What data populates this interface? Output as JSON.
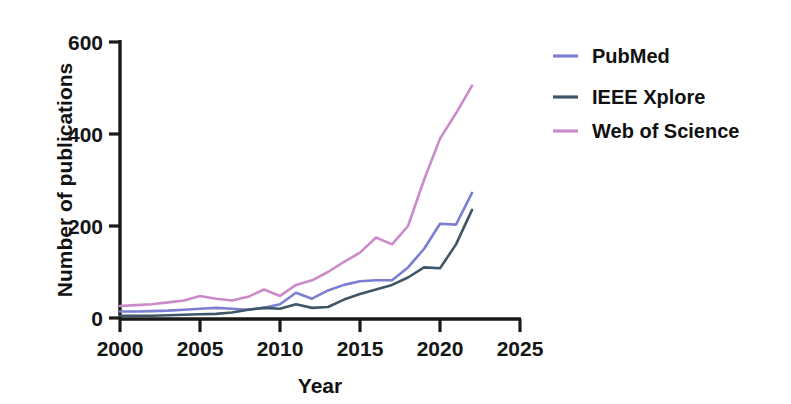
{
  "chart_data": {
    "type": "line",
    "title": "",
    "xlabel": "Year",
    "ylabel": "Number of publications",
    "xlim": [
      2000,
      2025
    ],
    "ylim": [
      0,
      600
    ],
    "xticks": [
      2000,
      2005,
      2010,
      2015,
      2020,
      2025
    ],
    "yticks": [
      0,
      200,
      400,
      600
    ],
    "grid": false,
    "legend_position": "right",
    "x": [
      2000,
      2001,
      2002,
      2003,
      2004,
      2005,
      2006,
      2007,
      2008,
      2009,
      2010,
      2011,
      2012,
      2013,
      2014,
      2015,
      2016,
      2017,
      2018,
      2019,
      2020,
      2021,
      2022
    ],
    "series": [
      {
        "name": "PubMed",
        "color": "#7B7FD4",
        "values": [
          14,
          14,
          15,
          16,
          18,
          20,
          22,
          20,
          18,
          22,
          30,
          55,
          42,
          60,
          72,
          80,
          82,
          82,
          110,
          150,
          205,
          203,
          272
        ]
      },
      {
        "name": "IEEE Xplore",
        "color": "#3E5668",
        "values": [
          5,
          5,
          5,
          6,
          7,
          8,
          9,
          12,
          18,
          22,
          20,
          30,
          22,
          24,
          40,
          52,
          62,
          72,
          88,
          110,
          108,
          160,
          235
        ]
      },
      {
        "name": "Web of Science",
        "color": "#CB8BC9",
        "values": [
          26,
          28,
          30,
          34,
          38,
          48,
          42,
          38,
          46,
          62,
          48,
          72,
          82,
          100,
          122,
          142,
          175,
          160,
          200,
          300,
          390,
          445,
          505
        ]
      }
    ]
  },
  "axes": {
    "y_tick_labels": [
      "600",
      "400",
      "200",
      "0"
    ],
    "x_tick_labels": [
      "2000",
      "2005",
      "2010",
      "2015",
      "2020",
      "2025"
    ],
    "x_title": "Year",
    "y_title": "Number of publications"
  },
  "legend": {
    "items": [
      {
        "label": "PubMed",
        "color": "#7B7FD4"
      },
      {
        "label": "IEEE Xplore",
        "color": "#3E5668"
      },
      {
        "label": "Web of Science",
        "color": "#CB8BC9"
      }
    ]
  }
}
